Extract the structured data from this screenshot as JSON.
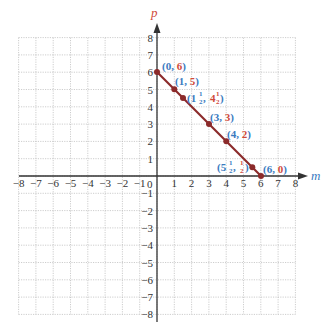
{
  "chart_data": {
    "type": "line",
    "title": "",
    "xlabel": "m",
    "ylabel": "p",
    "xlim": [
      -8,
      8
    ],
    "ylim": [
      -8,
      8
    ],
    "grid": true,
    "x_ticks": [
      -8,
      -7,
      -6,
      -5,
      -4,
      -3,
      -2,
      -1,
      0,
      1,
      2,
      3,
      4,
      5,
      6,
      7,
      8
    ],
    "y_ticks": [
      -8,
      -7,
      -6,
      -5,
      -4,
      -3,
      -2,
      -1,
      1,
      2,
      3,
      4,
      5,
      6,
      7,
      8
    ],
    "series": [
      {
        "name": "m + p = 6",
        "segment": [
          [
            0,
            6
          ],
          [
            6,
            0
          ]
        ],
        "points": [
          {
            "x": 0,
            "y": 6,
            "label_x": "0",
            "label_y": "6"
          },
          {
            "x": 1,
            "y": 5,
            "label_x": "1",
            "label_y": "5"
          },
          {
            "x": 1.5,
            "y": 4.5,
            "label_x": "1½",
            "label_y": "4½"
          },
          {
            "x": 3,
            "y": 3,
            "label_x": "3",
            "label_y": "3"
          },
          {
            "x": 4,
            "y": 2,
            "label_x": "4",
            "label_y": "2"
          },
          {
            "x": 5.5,
            "y": 0.5,
            "label_x": "5½",
            "label_y": "½"
          },
          {
            "x": 6,
            "y": 0,
            "label_x": "6",
            "label_y": "0"
          }
        ]
      }
    ],
    "colors": {
      "line": "#8b2a2a",
      "point": "#8b2a2a",
      "x_coord": "#3a7bbf",
      "y_coord": "#d04a3a",
      "axis": "#333333",
      "grid": "#b8b8b8",
      "x_axis_label": "#3a7bbf",
      "y_axis_label": "#d04a3a"
    }
  },
  "labels": {
    "p0": {
      "open": "(",
      "x": "0",
      "sep": ", ",
      "y": "6",
      "close": ")"
    },
    "p1": {
      "open": "(",
      "x": "1",
      "sep": ", ",
      "y": "5",
      "close": ")"
    },
    "p2": {
      "open": "(",
      "x_whole": "1",
      "x_num": "1",
      "x_den": "2",
      "sep": ", ",
      "y_whole": "4",
      "y_num": "1",
      "y_den": "2",
      "close": ")"
    },
    "p3": {
      "open": "(",
      "x": "3",
      "sep": ", ",
      "y": "3",
      "close": ")"
    },
    "p4": {
      "open": "(",
      "x": "4",
      "sep": ", ",
      "y": "2",
      "close": ")"
    },
    "p5": {
      "open": "(",
      "x_whole": "5",
      "x_num": "1",
      "x_den": "2",
      "sep": ", ",
      "y_num": "1",
      "y_den": "2",
      "close": ")"
    },
    "p6": {
      "open": "(",
      "x": "6",
      "sep": ", ",
      "y": "0",
      "close": ")"
    }
  },
  "axes": {
    "x_name": "m",
    "y_name": "p",
    "origin_label": "0"
  }
}
